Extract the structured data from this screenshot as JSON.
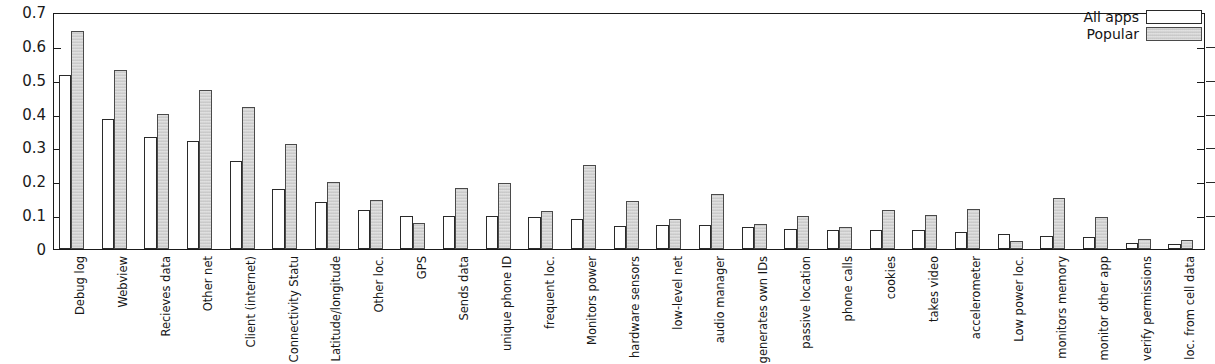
{
  "chart_data": {
    "type": "bar",
    "title": "",
    "subtitle": "",
    "xlabel": "",
    "ylabel": "",
    "ylim": [
      0,
      0.7
    ],
    "xlim_note": "28 categorical groups, 2 bars per group",
    "grid": false,
    "legend_position": "top-right",
    "ytick_labels": [
      "0.7",
      "0.6",
      "0.5",
      "0.4",
      "0.3",
      "0.2",
      "0.1",
      "0"
    ],
    "ytick_values": [
      0.7,
      0.6,
      0.5,
      0.4,
      0.3,
      0.2,
      0.1,
      0
    ],
    "categories": [
      "Debug log",
      "Webview",
      "Recieves data",
      "Other net",
      "Client (internet)",
      "Connectivity Statu",
      "Latitude/longitude",
      "Other loc.",
      "GPS",
      "Sends data",
      "unique phone ID",
      "frequent loc.",
      "Monitors power",
      "hardware sensors",
      "low-level net",
      "audio manager",
      "generates own IDs",
      "passive location",
      "phone calls",
      "cookies",
      "takes video",
      "accelerometer",
      "Low power loc.",
      "monitors memory",
      "monitor other app",
      "verify permissions",
      "loc. from cell data"
    ],
    "series": [
      {
        "name": "All apps",
        "color": "#ffffff",
        "values": [
          0.513,
          0.385,
          0.332,
          0.318,
          0.259,
          0.178,
          0.14,
          0.116,
          0.097,
          0.097,
          0.097,
          0.095,
          0.089,
          0.069,
          0.071,
          0.071,
          0.066,
          0.058,
          0.056,
          0.056,
          0.055,
          0.05,
          0.044,
          0.038,
          0.036,
          0.019,
          0.016
        ]
      },
      {
        "name": "Popular",
        "color": "#d2d2d2",
        "values": [
          0.643,
          0.529,
          0.398,
          0.471,
          0.42,
          0.31,
          0.198,
          0.145,
          0.077,
          0.18,
          0.194,
          0.113,
          0.248,
          0.141,
          0.09,
          0.162,
          0.074,
          0.098,
          0.065,
          0.116,
          0.099,
          0.117,
          0.025,
          0.151,
          0.096,
          0.031,
          0.026
        ]
      }
    ],
    "legend": [
      {
        "label": "All apps",
        "swatch": "unfilled-white"
      },
      {
        "label": "Popular",
        "swatch": "filled-gray"
      }
    ]
  }
}
